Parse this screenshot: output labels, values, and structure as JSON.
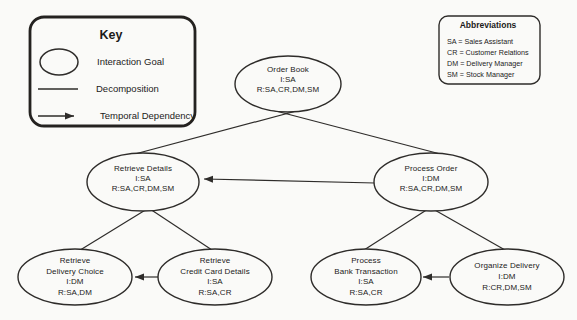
{
  "palette": {
    "background": "#fafaf8",
    "ink": "#2e2c2a",
    "text": "#1c1b1a"
  },
  "key": {
    "title": "Key",
    "items": [
      {
        "icon": "ellipse-symbol",
        "label": "Interaction Goal"
      },
      {
        "icon": "line-symbol",
        "label": "Decomposition"
      },
      {
        "icon": "arrow-symbol",
        "label": "Temporal Dependency"
      }
    ]
  },
  "abbreviations": {
    "title": "Abbreviations",
    "items": [
      "SA = Sales Assistant",
      "CR = Customer Relations",
      "DM = Delivery Manager",
      "SM = Stock Manager"
    ]
  },
  "nodes": {
    "order_book": {
      "lines": [
        "Order Book",
        "I:SA",
        "R:SA,CR,DM,SM"
      ]
    },
    "retrieve_details": {
      "lines": [
        "Retrieve Details",
        "I:SA",
        "R:SA,CR,DM,SM"
      ]
    },
    "process_order": {
      "lines": [
        "Process Order",
        "I:DM",
        "R:SA,CR,DM,SM"
      ]
    },
    "retrieve_delivery_choice": {
      "lines": [
        "Retrieve",
        "Delivery Choice",
        "I:DM",
        "R:SA,DM"
      ]
    },
    "retrieve_credit_card_details": {
      "lines": [
        "Retrieve",
        "Credit Card Details",
        "I:SA",
        "R:SA,CR"
      ]
    },
    "process_bank_transaction": {
      "lines": [
        "Process",
        "Bank Transaction",
        "I:SA",
        "R:SA,CR"
      ]
    },
    "organize_delivery": {
      "lines": [
        "Organize Delivery",
        "I:DM",
        "R:CR,DM,SM"
      ]
    }
  },
  "edges": {
    "decomposition": [
      {
        "from": "order_book",
        "to": "retrieve_details"
      },
      {
        "from": "order_book",
        "to": "process_order"
      },
      {
        "from": "retrieve_details",
        "to": "retrieve_delivery_choice"
      },
      {
        "from": "retrieve_details",
        "to": "retrieve_credit_card_details"
      },
      {
        "from": "process_order",
        "to": "process_bank_transaction"
      },
      {
        "from": "process_order",
        "to": "organize_delivery"
      }
    ],
    "temporal_dependency": [
      {
        "from": "process_order",
        "to": "retrieve_details"
      },
      {
        "from": "retrieve_credit_card_details",
        "to": "retrieve_delivery_choice"
      },
      {
        "from": "organize_delivery",
        "to": "process_bank_transaction"
      }
    ]
  }
}
